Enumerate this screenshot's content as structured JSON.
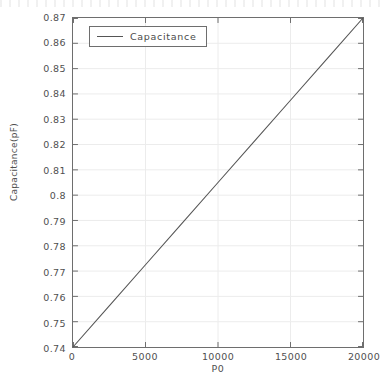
{
  "chart_data": {
    "type": "line",
    "title": "",
    "xlabel": "P0",
    "ylabel": "Capacitance(pF)",
    "xlim": [
      0,
      20000
    ],
    "ylim": [
      0.74,
      0.87
    ],
    "grid": true,
    "legend_position": "upper left",
    "xticks": [
      0,
      5000,
      10000,
      15000,
      20000
    ],
    "xtick_labels": [
      "0",
      "5000",
      "10000",
      "15000",
      "20000"
    ],
    "yticks": [
      0.74,
      0.75,
      0.76,
      0.77,
      0.78,
      0.79,
      0.8,
      0.81,
      0.82,
      0.83,
      0.84,
      0.85,
      0.86,
      0.87
    ],
    "ytick_labels": [
      "0.74",
      "0.75",
      "0.76",
      "0.77",
      "0.78",
      "0.79",
      "0.8",
      "0.81",
      "0.82",
      "0.83",
      "0.84",
      "0.85",
      "0.86",
      "0.87"
    ],
    "series": [
      {
        "name": "Capacitance",
        "color": "#555555",
        "x": [
          0,
          2500,
          5000,
          7500,
          10000,
          12500,
          15000,
          17500,
          20000
        ],
        "values": [
          0.74,
          0.75625,
          0.7725,
          0.78875,
          0.805,
          0.82125,
          0.8375,
          0.85375,
          0.87
        ]
      }
    ]
  },
  "legend": {
    "entries": [
      {
        "label": "Capacitance",
        "marker": "line-sample"
      }
    ]
  },
  "colors": {
    "axis": "#6e6e6e",
    "grid": "#ececec",
    "text": "#4f4f4f",
    "series": "#555555",
    "background": "#ffffff"
  }
}
